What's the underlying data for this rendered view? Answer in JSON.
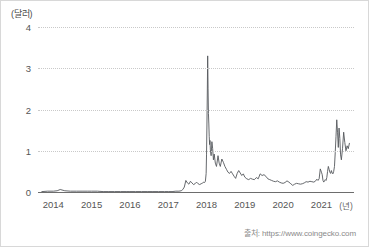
{
  "chart_data": {
    "type": "line",
    "title": "",
    "subtitle": "",
    "xlabel": "(년)",
    "ylabel": "(달러)",
    "xlim": [
      2013.6,
      2021.85
    ],
    "ylim": [
      0,
      4
    ],
    "grid": true,
    "legend": null,
    "yticks": [
      0,
      1,
      2,
      3,
      4
    ],
    "ytick_labels": [
      "0",
      "1",
      "2",
      "3",
      "4"
    ],
    "xticks": [
      2014,
      2015,
      2016,
      2017,
      2018,
      2019,
      2020,
      2021
    ],
    "xtick_labels": [
      "2014",
      "2015",
      "2016",
      "2017",
      "2018",
      "2019",
      "2020",
      "2021"
    ],
    "line_color": "#55585c",
    "grid_color": "#c9c9c9",
    "axis_color": "#6d6d6d",
    "source": "출처: https://www.coingecko.com",
    "series": [
      {
        "name": "price_usd",
        "x": [
          2013.7,
          2013.85,
          2014.0,
          2014.1,
          2014.18,
          2014.3,
          2014.45,
          2014.6,
          2014.75,
          2014.9,
          2015.0,
          2015.15,
          2015.3,
          2015.45,
          2015.6,
          2015.75,
          2015.9,
          2016.0,
          2016.15,
          2016.3,
          2016.45,
          2016.6,
          2016.75,
          2016.9,
          2017.0,
          2017.1,
          2017.2,
          2017.28,
          2017.34,
          2017.38,
          2017.42,
          2017.46,
          2017.5,
          2017.54,
          2017.58,
          2017.62,
          2017.66,
          2017.7,
          2017.74,
          2017.78,
          2017.82,
          2017.86,
          2017.9,
          2017.93,
          2017.95,
          2017.97,
          2017.99,
          2018.0,
          2018.01,
          2018.02,
          2018.03,
          2018.04,
          2018.05,
          2018.06,
          2018.07,
          2018.08,
          2018.09,
          2018.1,
          2018.12,
          2018.14,
          2018.16,
          2018.18,
          2018.2,
          2018.23,
          2018.26,
          2018.3,
          2018.33,
          2018.36,
          2018.4,
          2018.44,
          2018.48,
          2018.52,
          2018.56,
          2018.6,
          2018.64,
          2018.68,
          2018.72,
          2018.76,
          2018.8,
          2018.84,
          2018.88,
          2018.92,
          2018.96,
          2019.0,
          2019.05,
          2019.1,
          2019.15,
          2019.2,
          2019.25,
          2019.3,
          2019.35,
          2019.4,
          2019.45,
          2019.5,
          2019.55,
          2019.6,
          2019.65,
          2019.7,
          2019.75,
          2019.8,
          2019.85,
          2019.9,
          2019.95,
          2020.0,
          2020.05,
          2020.1,
          2020.15,
          2020.2,
          2020.25,
          2020.3,
          2020.35,
          2020.4,
          2020.45,
          2020.5,
          2020.55,
          2020.6,
          2020.65,
          2020.7,
          2020.75,
          2020.8,
          2020.84,
          2020.88,
          2020.91,
          2020.94,
          2020.97,
          2021.0,
          2021.02,
          2021.04,
          2021.06,
          2021.08,
          2021.1,
          2021.12,
          2021.14,
          2021.16,
          2021.18,
          2021.2,
          2021.22,
          2021.24,
          2021.26,
          2021.28,
          2021.3,
          2021.32,
          2021.34,
          2021.36,
          2021.38,
          2021.4,
          2021.42,
          2021.44,
          2021.46,
          2021.48,
          2021.5,
          2021.52,
          2021.55,
          2021.58,
          2021.61,
          2021.64,
          2021.67,
          2021.7,
          2021.73
        ],
        "y": [
          0.01,
          0.02,
          0.02,
          0.03,
          0.06,
          0.03,
          0.02,
          0.02,
          0.02,
          0.02,
          0.02,
          0.02,
          0.01,
          0.01,
          0.01,
          0.01,
          0.01,
          0.01,
          0.01,
          0.01,
          0.01,
          0.01,
          0.01,
          0.01,
          0.01,
          0.01,
          0.02,
          0.02,
          0.03,
          0.06,
          0.12,
          0.28,
          0.22,
          0.19,
          0.26,
          0.22,
          0.18,
          0.2,
          0.24,
          0.2,
          0.18,
          0.2,
          0.22,
          0.24,
          0.23,
          0.26,
          0.45,
          0.9,
          1.6,
          2.4,
          3.3,
          2.5,
          1.9,
          1.65,
          1.35,
          1.15,
          1.25,
          1.02,
          0.88,
          1.22,
          1.05,
          0.78,
          0.92,
          0.7,
          0.62,
          0.88,
          0.7,
          0.62,
          0.8,
          0.72,
          0.62,
          0.55,
          0.48,
          0.45,
          0.5,
          0.44,
          0.38,
          0.33,
          0.45,
          0.52,
          0.46,
          0.4,
          0.44,
          0.36,
          0.32,
          0.3,
          0.33,
          0.31,
          0.3,
          0.35,
          0.32,
          0.44,
          0.4,
          0.42,
          0.38,
          0.32,
          0.3,
          0.28,
          0.26,
          0.25,
          0.27,
          0.24,
          0.22,
          0.21,
          0.23,
          0.27,
          0.24,
          0.2,
          0.16,
          0.19,
          0.21,
          0.2,
          0.19,
          0.2,
          0.22,
          0.25,
          0.24,
          0.26,
          0.25,
          0.24,
          0.26,
          0.31,
          0.28,
          0.32,
          0.56,
          0.48,
          0.42,
          0.28,
          0.24,
          0.27,
          0.3,
          0.28,
          0.35,
          0.5,
          0.62,
          0.55,
          0.48,
          0.45,
          0.52,
          0.46,
          0.44,
          0.5,
          0.62,
          0.95,
          1.35,
          1.75,
          1.45,
          1.08,
          1.55,
          1.3,
          0.9,
          0.78,
          1.05,
          1.45,
          1.2,
          1.0,
          1.12,
          1.05,
          1.18
        ]
      }
    ]
  }
}
